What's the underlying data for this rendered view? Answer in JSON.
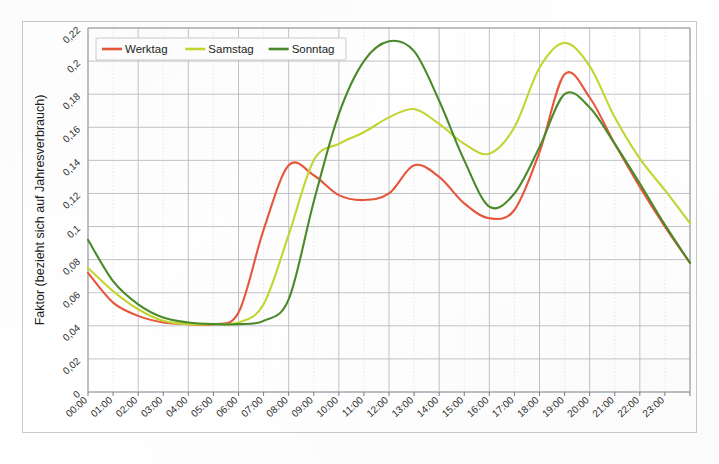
{
  "chart_data": {
    "type": "line",
    "title": "",
    "xlabel": "",
    "ylabel": "Faktor (bezieht sich auf Jahresverbrauch)",
    "xlim": [
      0,
      24
    ],
    "ylim": [
      0,
      0.22
    ],
    "grid": true,
    "legend_position": "top-left-inside",
    "x_tick_labels": [
      "00:00",
      "01:00",
      "02:00",
      "03:00",
      "04:00",
      "05:00",
      "06:00",
      "07:00",
      "08:00",
      "09:00",
      "10:00",
      "11:00",
      "12:00",
      "13:00",
      "14:00",
      "15:00",
      "16:00",
      "17:00",
      "18:00",
      "19:00",
      "20:00",
      "21:00",
      "22:00",
      "23:00"
    ],
    "y_tick_labels": [
      "0",
      "0,02",
      "0,04",
      "0,06",
      "0,08",
      "0,1",
      "0,12",
      "0,14",
      "0,16",
      "0,18",
      "0,2",
      "0,22"
    ],
    "y_tick_values": [
      0,
      0.02,
      0.04,
      0.06,
      0.08,
      0.1,
      0.12,
      0.14,
      0.16,
      0.18,
      0.2,
      0.22
    ],
    "x": [
      0,
      1,
      2,
      3,
      4,
      5,
      6,
      7,
      8,
      9,
      10,
      11,
      12,
      13,
      14,
      15,
      16,
      17,
      18,
      19,
      20,
      21,
      22,
      23,
      24
    ],
    "series": [
      {
        "name": "Werktag",
        "color": "#e8563c",
        "values": [
          0.072,
          0.054,
          0.046,
          0.042,
          0.041,
          0.041,
          0.048,
          0.098,
          0.137,
          0.131,
          0.119,
          0.116,
          0.12,
          0.137,
          0.13,
          0.114,
          0.105,
          0.11,
          0.145,
          0.192,
          0.178,
          0.15,
          0.124,
          0.1,
          0.078
        ]
      },
      {
        "name": "Samstag",
        "color": "#c3d631",
        "values": [
          0.075,
          0.061,
          0.05,
          0.043,
          0.041,
          0.041,
          0.042,
          0.053,
          0.095,
          0.14,
          0.15,
          0.157,
          0.166,
          0.171,
          0.162,
          0.15,
          0.144,
          0.16,
          0.196,
          0.211,
          0.197,
          0.166,
          0.141,
          0.122,
          0.102
        ]
      },
      {
        "name": "Sonntag",
        "color": "#4a8a2a",
        "values": [
          0.092,
          0.067,
          0.053,
          0.045,
          0.042,
          0.041,
          0.041,
          0.043,
          0.056,
          0.115,
          0.168,
          0.2,
          0.212,
          0.206,
          0.176,
          0.14,
          0.112,
          0.12,
          0.148,
          0.18,
          0.172,
          0.15,
          0.126,
          0.101,
          0.078
        ]
      }
    ]
  },
  "legend": {
    "entries": [
      {
        "label": "Werktag",
        "color": "#e8563c"
      },
      {
        "label": "Samstag",
        "color": "#c3d631"
      },
      {
        "label": "Sonntag",
        "color": "#4a8a2a"
      }
    ]
  },
  "axes": {
    "y_axis_title": "Faktor (bezieht sich auf Jahresverbrauch)"
  }
}
